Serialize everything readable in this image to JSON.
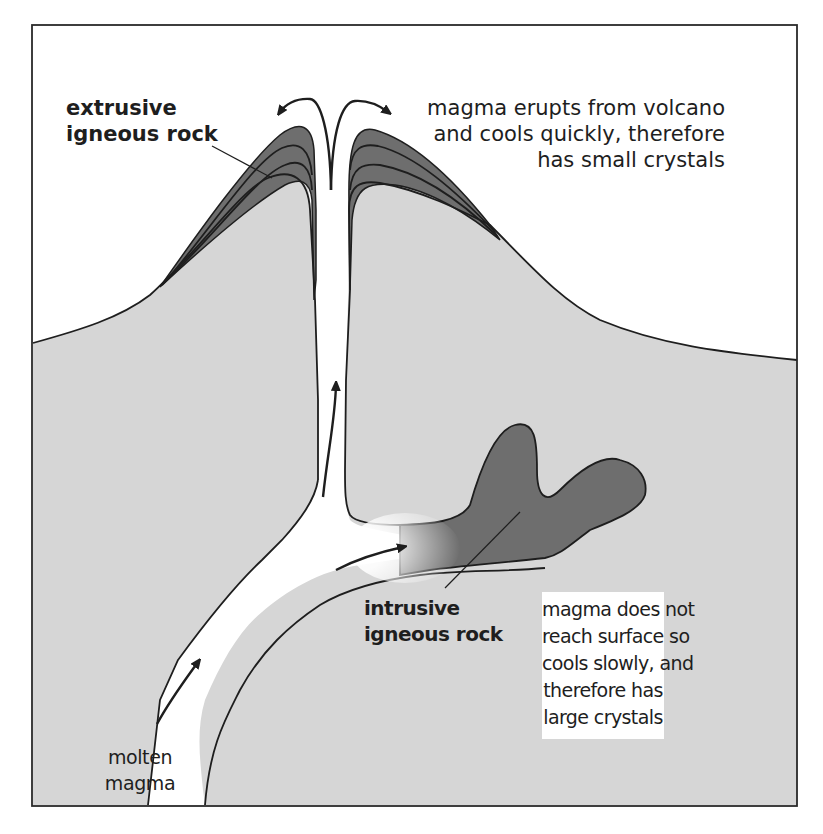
{
  "diagram": {
    "colors": {
      "background": "#ffffff",
      "ground": "#d6d6d6",
      "igneous_rock": "#6e6e6e",
      "magma": "#ffffff",
      "outline": "#1e1e1e"
    },
    "labels": {
      "extrusive": {
        "line1": "extrusive",
        "line2": "igneous rock"
      },
      "extrusive_note": {
        "line1": "magma erupts from volcano",
        "line2": "and cools quickly, therefore",
        "line3": "has small crystals"
      },
      "intrusive": {
        "line1": "intrusive",
        "line2": "igneous rock"
      },
      "intrusive_note": {
        "line1": "magma does not",
        "line2": "reach surface so",
        "line3": "cools slowly, and",
        "line4": "therefore has",
        "line5": "large crystals"
      },
      "molten_magma": {
        "line1": "molten",
        "line2": "magma"
      }
    },
    "arrows": [
      {
        "name": "eruption-arrow-left",
        "direction": "up-left"
      },
      {
        "name": "eruption-arrow-right",
        "direction": "up-right"
      },
      {
        "name": "vent-flow-arrow",
        "direction": "up"
      },
      {
        "name": "intrusion-flow-arrow",
        "direction": "right"
      },
      {
        "name": "base-flow-arrow",
        "direction": "up-right"
      }
    ]
  }
}
